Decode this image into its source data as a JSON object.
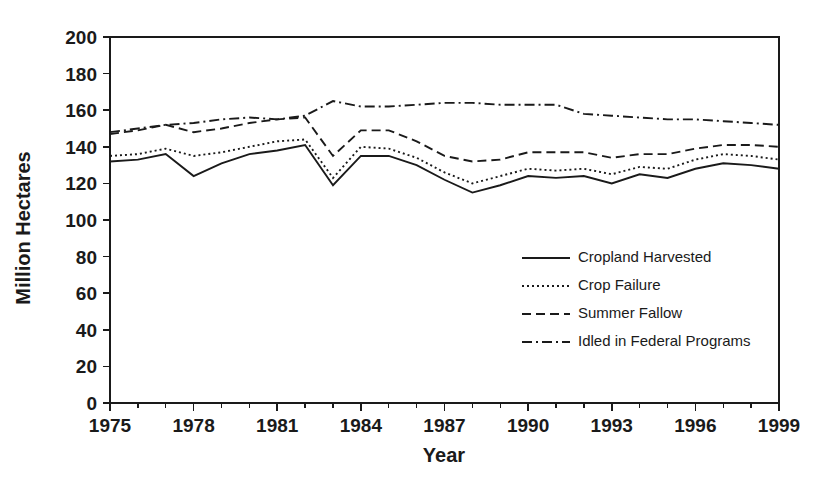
{
  "chart_data": {
    "type": "line",
    "title": "",
    "xlabel": "Year",
    "ylabel": "Million Hectares",
    "xlim": [
      1975,
      1999
    ],
    "ylim": [
      0,
      200
    ],
    "grid": false,
    "legend_position": "center-right-inside",
    "xticks": [
      1975,
      1978,
      1981,
      1984,
      1987,
      1990,
      1993,
      1996,
      1999
    ],
    "xtick_labels": [
      "1975",
      "1978",
      "1981",
      "1984",
      "1987",
      "1990",
      "1993",
      "1996",
      "1999"
    ],
    "xtick_minor_step": 1,
    "yticks": [
      0,
      20,
      40,
      60,
      80,
      100,
      120,
      140,
      160,
      180,
      200
    ],
    "ytick_labels": [
      "0",
      "20",
      "40",
      "60",
      "80",
      "100",
      "120",
      "140",
      "160",
      "180",
      "200"
    ],
    "x": [
      1975,
      1976,
      1977,
      1978,
      1979,
      1980,
      1981,
      1982,
      1983,
      1984,
      1985,
      1986,
      1987,
      1988,
      1989,
      1990,
      1991,
      1992,
      1993,
      1994,
      1995,
      1996,
      1997,
      1998,
      1999
    ],
    "series": [
      {
        "name": "Cropland Harvested",
        "line_style": "solid",
        "values": [
          132,
          133,
          136,
          124,
          131,
          136,
          138,
          141,
          119,
          135,
          135,
          130,
          122,
          115,
          119,
          124,
          123,
          124,
          120,
          125,
          123,
          128,
          131,
          130,
          128
        ]
      },
      {
        "name": "Crop Failure",
        "line_style": "dotted",
        "values": [
          135,
          136,
          139,
          135,
          137,
          140,
          143,
          144,
          123,
          140,
          139,
          134,
          126,
          120,
          124,
          128,
          127,
          128,
          125,
          129,
          128,
          133,
          136,
          135,
          133
        ]
      },
      {
        "name": "Summer Fallow",
        "line_style": "dashed",
        "values": [
          147,
          149,
          152,
          148,
          150,
          153,
          155,
          156,
          135,
          149,
          149,
          143,
          135,
          132,
          133,
          137,
          137,
          137,
          134,
          136,
          136,
          139,
          141,
          141,
          140
        ]
      },
      {
        "name": "Idled in Federal Programs",
        "line_style": "dashdot",
        "values": [
          148,
          150,
          152,
          153,
          155,
          156,
          155,
          157,
          165,
          162,
          162,
          163,
          164,
          164,
          163,
          163,
          163,
          158,
          157,
          156,
          155,
          155,
          154,
          153,
          152
        ]
      }
    ]
  },
  "legend": {
    "items": [
      {
        "label": "Cropland Harvested",
        "style": "solid"
      },
      {
        "label": "Crop Failure",
        "style": "dotted"
      },
      {
        "label": "Summer Fallow",
        "style": "dashed"
      },
      {
        "label": "Idled in Federal Programs",
        "style": "dashdot"
      }
    ]
  },
  "colors": {
    "ink": "#1a1a1a",
    "background": "#ffffff"
  }
}
